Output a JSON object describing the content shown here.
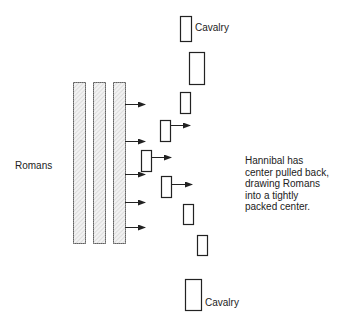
{
  "labels": {
    "romans": "Romans",
    "cavalry_top": "Cavalry",
    "cavalry_bottom": "Cavalry",
    "note": "Hannibal has\ncenter pulled back,\ndrawing Romans\ninto a tightly\npacked center."
  },
  "colors": {
    "stroke": "#222222",
    "roman_fill": "#eeeeee",
    "background": "#ffffff"
  },
  "romans": {
    "bars": [
      {
        "x": 73,
        "y": 82,
        "w": 12,
        "h": 161
      },
      {
        "x": 93,
        "y": 82,
        "w": 12,
        "h": 161
      },
      {
        "x": 113,
        "y": 82,
        "w": 12,
        "h": 161
      }
    ],
    "arrows_y": [
      104,
      141,
      174,
      202,
      227
    ]
  },
  "carthaginians": {
    "units": [
      {
        "x": 180,
        "y": 16,
        "w": 11,
        "h": 25
      },
      {
        "x": 189,
        "y": 52,
        "w": 15,
        "h": 32
      },
      {
        "x": 180,
        "y": 92,
        "w": 10,
        "h": 21
      },
      {
        "x": 160,
        "y": 120,
        "w": 10,
        "h": 21
      },
      {
        "x": 141,
        "y": 150,
        "w": 10,
        "h": 21
      },
      {
        "x": 161,
        "y": 176,
        "w": 10,
        "h": 21
      },
      {
        "x": 183,
        "y": 204,
        "w": 10,
        "h": 20
      },
      {
        "x": 197,
        "y": 235,
        "w": 10,
        "h": 20
      },
      {
        "x": 185,
        "y": 279,
        "w": 16,
        "h": 31
      }
    ],
    "arrows": [
      {
        "x1": 170,
        "y1": 125,
        "x2": 190
      },
      {
        "x1": 151,
        "y1": 157,
        "x2": 171
      },
      {
        "x1": 171,
        "y1": 184,
        "x2": 192
      }
    ]
  }
}
